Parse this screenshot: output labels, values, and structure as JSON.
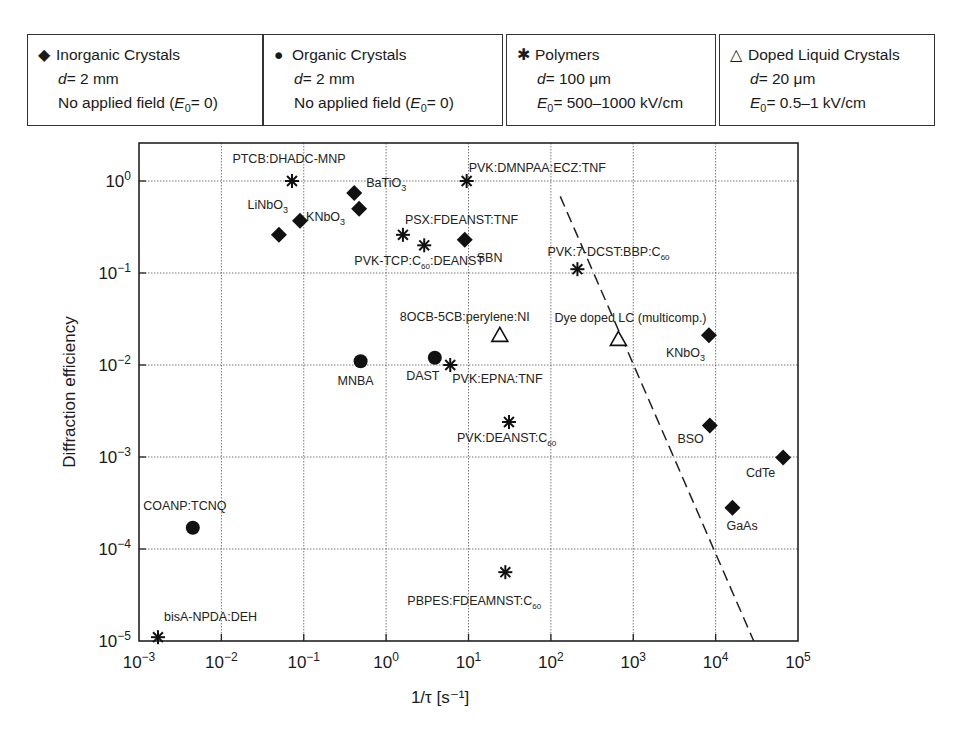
{
  "legend": [
    {
      "symbol": "diamond",
      "glyph": "◆",
      "title": "Inorganic Crystals",
      "line2_var": "d",
      "line2": "= 2 mm",
      "line3_pre": "No applied field (",
      "line3_var": "E",
      "line3_sub": "0",
      "line3_post": "= 0)"
    },
    {
      "symbol": "circle",
      "glyph": "●",
      "title": "Organic Crystals",
      "line2_var": "d",
      "line2": "= 2 mm",
      "line3_pre": "No applied field (",
      "line3_var": "E",
      "line3_sub": "0",
      "line3_post": "= 0)"
    },
    {
      "symbol": "star",
      "glyph": "✱",
      "title": "Polymers",
      "line2_var": "d",
      "line2": "= 100 μm",
      "line3_pre": "",
      "line3_var": "E",
      "line3_sub": "0",
      "line3_post": "= 500–1000 kV/cm"
    },
    {
      "symbol": "triangle",
      "glyph": "△",
      "title": "Doped Liquid Crystals",
      "line2_var": "d",
      "line2": "= 20 μm",
      "line3_pre": "",
      "line3_var": "E",
      "line3_sub": "0",
      "line3_post": "= 0.5–1 kV/cm"
    }
  ],
  "chart_data": {
    "type": "scatter",
    "title": "",
    "xlabel": "1/τ [s⁻¹]",
    "ylabel": "Diffraction efficiency",
    "xscale": "log",
    "yscale": "log",
    "xlim": [
      0.001,
      100000
    ],
    "ylim": [
      1e-05,
      3
    ],
    "grid": true,
    "legend_position": "top (boxes above plot)",
    "x_ticks": [
      "10⁻³",
      "10⁻²",
      "10⁻¹",
      "10⁰",
      "10¹",
      "10²",
      "10³",
      "10⁴",
      "10⁵"
    ],
    "y_ticks": [
      "10⁻⁵",
      "10⁻⁴",
      "10⁻³",
      "10⁻²",
      "10⁻¹",
      "10⁰"
    ],
    "series": [
      {
        "name": "Inorganic Crystals",
        "marker": "diamond",
        "points": [
          {
            "label": "BaTiO3",
            "x": 0.41,
            "y": 0.74
          },
          {
            "label": "KNbO3",
            "x": 0.47,
            "y": 0.5
          },
          {
            "label": "LiNbO3",
            "x": 0.09,
            "y": 0.37
          },
          {
            "label": "LiNbO3",
            "x": 0.05,
            "y": 0.26
          },
          {
            "label": "SBN",
            "x": 9,
            "y": 0.23
          },
          {
            "label": "KNbO3",
            "x": 8300,
            "y": 0.021
          },
          {
            "label": "BSO",
            "x": 8500,
            "y": 0.0022
          },
          {
            "label": "CdTe",
            "x": 66000,
            "y": 0.00099
          },
          {
            "label": "GaAs",
            "x": 16000,
            "y": 0.00028
          }
        ]
      },
      {
        "name": "Organic Crystals",
        "marker": "circle",
        "points": [
          {
            "label": "MNBA",
            "x": 0.49,
            "y": 0.011
          },
          {
            "label": "DAST",
            "x": 3.9,
            "y": 0.012
          },
          {
            "label": "COANP:TCNQ",
            "x": 0.0045,
            "y": 0.00017
          }
        ]
      },
      {
        "name": "Polymers",
        "marker": "star",
        "points": [
          {
            "label": "PTCB:DHADC-MNP",
            "x": 0.072,
            "y": 1.0
          },
          {
            "label": "PVK:DMNPAA:ECZ:TNF",
            "x": 9.5,
            "y": 1.0
          },
          {
            "label": "PSX:FDEANST:TNF",
            "x": 1.6,
            "y": 0.26
          },
          {
            "label": "PVK-TCP:C60:DEANST",
            "x": 2.9,
            "y": 0.2
          },
          {
            "label": "PVK:7-DCST:BBP:C60",
            "x": 210,
            "y": 0.11
          },
          {
            "label": "PVK:EPNA:TNF",
            "x": 6,
            "y": 0.01
          },
          {
            "label": "PVK:DEANST:C60",
            "x": 31,
            "y": 0.0024
          },
          {
            "label": "PBPES:FDEAMNST:C60",
            "x": 28,
            "y": 5.6e-05
          },
          {
            "label": "bisA-NPDA:DEH",
            "x": 0.0017,
            "y": 1.1e-05
          }
        ]
      },
      {
        "name": "Doped Liquid Crystals",
        "marker": "triangle",
        "points": [
          {
            "label": "8OCB-5CB:perylene:NI",
            "x": 24,
            "y": 0.021
          },
          {
            "label": "Dye doped LC (multicomp.)",
            "x": 660,
            "y": 0.019
          }
        ]
      }
    ],
    "annotations": [
      {
        "type": "dashed-line",
        "from": {
          "x": 130,
          "y": 0.68
        },
        "to": {
          "x": 29000,
          "y": 1e-05
        }
      }
    ]
  }
}
